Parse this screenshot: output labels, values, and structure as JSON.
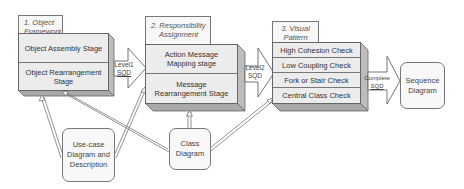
{
  "diagram": {
    "stage1": {
      "tab": "1. Object Framework",
      "tab_line1": "1. Object",
      "tab_line2": "Framework",
      "rows": [
        "Object Assembly Stage",
        "Object Rearrangement Stage"
      ]
    },
    "stage2": {
      "tab": "2. Responsibility Assignment",
      "tab_line1": "2. Responsibility",
      "tab_line2": "Assignment",
      "rows": [
        "Action Message Mapping stage",
        "Message Rearrangement Stage"
      ]
    },
    "stage3": {
      "tab": "3. Visual Pattern",
      "tab_line1": "3. Visual",
      "tab_line2": "Pattern",
      "rows": [
        "High Cohesion Check",
        "Low Coupling Check",
        "Fork or Stair Check",
        "Central Class Check"
      ]
    },
    "arrows": {
      "level1": {
        "line1": "Level1",
        "line2": "SQD"
      },
      "level2": {
        "line1": "Level2",
        "line2": "SQD"
      },
      "complete": {
        "line1": "Complete",
        "line2": "SQD"
      }
    },
    "inputs": {
      "usecase": "Use-case Diagram and Description",
      "class": "Class Diagram"
    },
    "output": "Sequence Diagram",
    "colors": {
      "box_fill": "#ececec",
      "box_side": "#bdbdbd",
      "box_bottom": "#a9a9a9",
      "stroke": "#666666"
    }
  }
}
